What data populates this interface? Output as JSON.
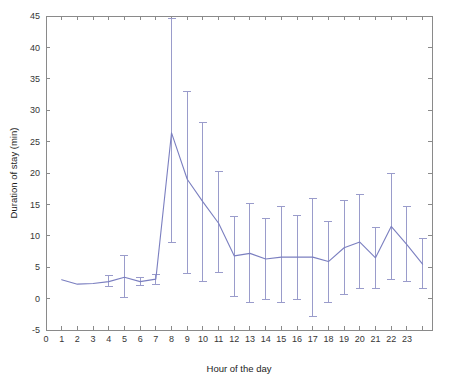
{
  "chart_data": {
    "type": "line",
    "title": "",
    "xlabel": "Hour of the day",
    "ylabel": "Duration of stay (min)",
    "xlim": [
      0,
      24.6
    ],
    "ylim": [
      -5,
      45
    ],
    "grid": false,
    "legend": null,
    "line_color": "#7b7fc0",
    "errorbar_color": "#9a9ccb",
    "axis_color": "#8a8a8a",
    "xticks": [
      0,
      1,
      2,
      3,
      4,
      5,
      6,
      7,
      8,
      9,
      10,
      11,
      12,
      13,
      14,
      15,
      16,
      17,
      18,
      19,
      20,
      21,
      22,
      23
    ],
    "xtick_labels": [
      "0",
      "1",
      "2",
      "3",
      "4",
      "5",
      "6",
      "7",
      "8",
      "9",
      "10",
      "11",
      "12",
      "13",
      "14",
      "15",
      "16",
      "17",
      "18",
      "19",
      "20",
      "21",
      "22",
      "23"
    ],
    "yticks": [
      -5,
      0,
      5,
      10,
      15,
      20,
      25,
      30,
      35,
      40,
      45
    ],
    "ytick_labels": [
      "-5",
      "0",
      "5",
      "10",
      "15",
      "20",
      "25",
      "30",
      "35",
      "40",
      "45"
    ],
    "x": [
      1,
      2,
      3,
      4,
      5,
      6,
      7,
      8,
      9,
      10,
      11,
      12,
      13,
      14,
      15,
      16,
      17,
      18,
      19,
      20,
      21,
      22,
      23,
      24
    ],
    "values": [
      3.0,
      2.3,
      2.4,
      2.7,
      3.4,
      2.7,
      3.1,
      26.4,
      19.0,
      15.4,
      12.0,
      6.8,
      7.2,
      6.3,
      6.6,
      6.6,
      6.6,
      5.9,
      8.1,
      9.0,
      6.5,
      11.5,
      8.6,
      5.5
    ],
    "err_low": [
      3.0,
      2.3,
      2.4,
      1.9,
      0.1,
      2.1,
      2.2,
      8.9,
      4.0,
      2.7,
      4.2,
      0.4,
      -0.7,
      -0.2,
      -0.6,
      -0.2,
      -2.8,
      -0.6,
      0.7,
      1.6,
      1.6,
      3.1,
      2.7,
      1.6
    ],
    "err_high": [
      3.0,
      2.3,
      2.4,
      3.6,
      6.8,
      3.3,
      3.9,
      44.6,
      33.0,
      28.0,
      20.2,
      13.1,
      15.2,
      12.7,
      14.7,
      13.3,
      16.0,
      12.3,
      15.6,
      16.5,
      11.4,
      19.9,
      14.6,
      9.5
    ]
  },
  "axis_labels": {
    "x_title": "Hour of the day",
    "y_title": "Duration of stay (min)"
  }
}
